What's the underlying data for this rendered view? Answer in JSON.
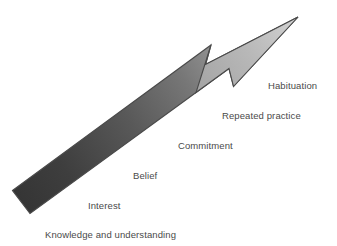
{
  "diagram": {
    "type": "progression-arrow",
    "title": "",
    "background_color": "#ffffff",
    "arrow": {
      "name": "upward-progression-arrow",
      "direction": "lower-left-to-upper-right",
      "gradient_start_color": "#3a3a3a",
      "gradient_end_color": "#c9c9c9",
      "outline_color": "#4f4f4f",
      "tail_point": {
        "x": 12,
        "y": 201
      },
      "tip_point": {
        "x": 298,
        "y": 17
      }
    },
    "label_color": "#4a4a4a",
    "stages": [
      {
        "id": "knowledge-and-understanding",
        "label": "Knowledge and understanding",
        "order": 1,
        "x": 45,
        "y": 229
      },
      {
        "id": "interest",
        "label": "Interest",
        "order": 2,
        "x": 88,
        "y": 200
      },
      {
        "id": "belief",
        "label": "Belief",
        "order": 3,
        "x": 133,
        "y": 170
      },
      {
        "id": "commitment",
        "label": "Commitment",
        "order": 4,
        "x": 178,
        "y": 140
      },
      {
        "id": "repeated-practice",
        "label": "Repeated practice",
        "order": 5,
        "x": 222,
        "y": 110
      },
      {
        "id": "habituation",
        "label": "Habituation",
        "order": 6,
        "x": 268,
        "y": 80
      }
    ]
  }
}
